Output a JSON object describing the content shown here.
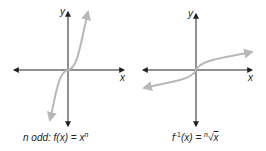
{
  "graphs": [
    {
      "id": "odd-power",
      "axis_labels": {
        "x": "x",
        "y": "y"
      },
      "caption": {
        "prefix": "n odd: ",
        "func": "f(x) = x",
        "exp": "n"
      },
      "curve_color": "#b8b8b8"
    },
    {
      "id": "inverse-root",
      "axis_labels": {
        "x": "x",
        "y": "y"
      },
      "caption": {
        "func": "f",
        "exp": "-1",
        "rest": "(x) = ",
        "root_index": "n",
        "radical": "√",
        "radicand": "x"
      },
      "curve_color": "#b8b8b8"
    }
  ],
  "colors": {
    "axis": "#222222",
    "curve": "#b8b8b8"
  }
}
